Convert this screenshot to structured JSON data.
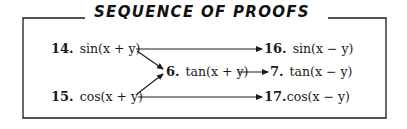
{
  "title": "SEQUENCE OF PROOFS",
  "proofs": {
    "p14": {
      "number": "14.",
      "expression": "sin(x + y)"
    },
    "p15": {
      "number": "15.",
      "expression": "cos(x + y)"
    },
    "p6": {
      "number": "6.",
      "expression": "tan(x + y)"
    },
    "p16": {
      "number": "16.",
      "expression": "sin(x − y)"
    },
    "p7": {
      "number": "7.",
      "expression": "tan(x − y)"
    },
    "p17": {
      "number": "17.",
      "expression": "cos(x − y)"
    }
  },
  "arrows": [
    {
      "from": "14",
      "to": "16"
    },
    {
      "from": "14",
      "to": "6"
    },
    {
      "from": "15",
      "to": "6"
    },
    {
      "from": "6",
      "to": "7"
    },
    {
      "from": "15",
      "to": "17"
    }
  ],
  "colors": {
    "line": "#1a1a1a",
    "background": "#ffffff"
  }
}
